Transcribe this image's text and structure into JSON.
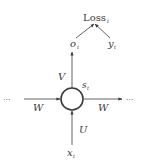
{
  "diagram": {
    "type": "rnn-unit",
    "colors": {
      "stroke": "#3a3a3a",
      "background": "#ffffff"
    },
    "nodes": {
      "loss": {
        "label": "Loss",
        "subscript": "t"
      },
      "output": {
        "label": "o",
        "subscript": "t"
      },
      "target": {
        "label": "y",
        "subscript": "t"
      },
      "hidden_state": {
        "label": "s",
        "subscript": "t"
      },
      "input": {
        "label": "x",
        "subscript": "t"
      },
      "prev_ellipsis": {
        "label": "···"
      },
      "next_ellipsis": {
        "label": "···"
      }
    },
    "edges": {
      "input_to_hidden": {
        "weight": "U"
      },
      "hidden_to_output": {
        "weight": "V"
      },
      "prev_to_hidden": {
        "weight": "W"
      },
      "hidden_to_next": {
        "weight": "W"
      },
      "output_to_loss": {},
      "target_to_loss": {}
    }
  }
}
